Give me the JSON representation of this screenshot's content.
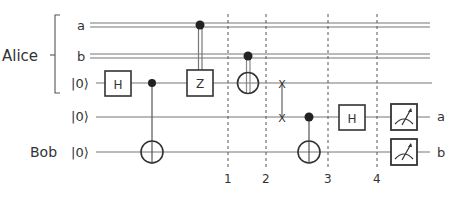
{
  "diagram": {
    "type": "quantum-circuit",
    "groups": [
      {
        "label": "Alice",
        "wires": [
          "a",
          "b",
          "q0"
        ]
      },
      {
        "label": "Bob",
        "wires": [
          "bob"
        ]
      }
    ],
    "wires": [
      {
        "id": "a",
        "label": "a",
        "kind": "classical"
      },
      {
        "id": "b",
        "label": "b",
        "kind": "classical"
      },
      {
        "id": "q0",
        "label": "|0⟩",
        "kind": "quantum"
      },
      {
        "id": "q1",
        "label": "|0⟩",
        "kind": "quantum"
      },
      {
        "id": "bob",
        "label": "|0⟩",
        "kind": "quantum"
      }
    ],
    "gates": [
      {
        "type": "H",
        "label": "H",
        "wire": "q0"
      },
      {
        "type": "CNOT",
        "control": "q0",
        "target": "bob"
      },
      {
        "type": "CZ",
        "label": "Z",
        "control": "a",
        "target": "q0"
      },
      {
        "type": "CNOT",
        "control": "b",
        "target": "q0"
      },
      {
        "type": "SWAP",
        "wires": [
          "q0",
          "q1"
        ],
        "glyph": "X"
      },
      {
        "type": "CNOT",
        "control": "q1",
        "target": "bob"
      },
      {
        "type": "H",
        "label": "H",
        "wire": "q1"
      },
      {
        "type": "Measure",
        "wire": "q1",
        "output": "a"
      },
      {
        "type": "Measure",
        "wire": "bob",
        "output": "b"
      }
    ],
    "barriers": [
      "1",
      "2",
      "3",
      "4"
    ],
    "outputs": [
      "a",
      "b"
    ],
    "labels": {
      "alice": "Alice",
      "bob": "Bob",
      "wire_a": "a",
      "wire_b": "b",
      "ket_q0": "|0⟩",
      "ket_q1": "|0⟩",
      "ket_bob": "|0⟩",
      "gate_h1": "H",
      "gate_z": "Z",
      "gate_h2": "H",
      "barrier_1": "1",
      "barrier_2": "2",
      "barrier_3": "3",
      "barrier_4": "4",
      "out_a": "a",
      "out_b": "b",
      "swap_glyph": "X"
    }
  }
}
